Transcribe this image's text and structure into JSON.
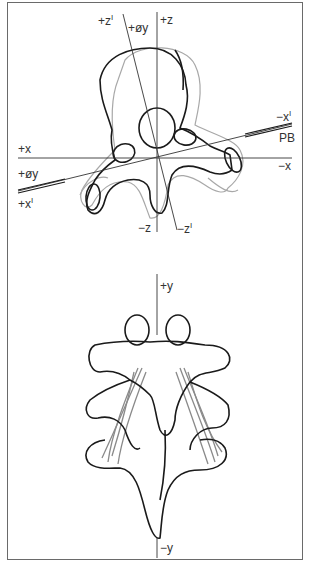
{
  "figure": {
    "top_view": {
      "title": "Vertebra superior view with coordinate axes",
      "axis_labels": {
        "plus_z_prime": "+z",
        "plus_z_prime_mark": "I",
        "plus_phi_y_top": "+øy",
        "plus_z": "+z",
        "minus_x_prime": "−x",
        "minus_x_prime_mark": "I",
        "pb": "PB",
        "plus_x": "+x",
        "minus_x": "−x",
        "plus_phi_y": "+øy",
        "plus_x_prime": "+x",
        "plus_x_prime_mark": "I",
        "minus_z": "−z",
        "minus_z_prime": "−z",
        "minus_z_prime_mark": "I"
      }
    },
    "bottom_view": {
      "title": "Vertebrae posterior view with ligaments",
      "axis_labels": {
        "plus_y": "+y",
        "minus_y": "−y"
      }
    },
    "colors": {
      "ink": "#1a1a1a",
      "ghost": "#a8a8a8",
      "ligament": "#8a8a8a",
      "border": "#6a6a6a"
    }
  }
}
